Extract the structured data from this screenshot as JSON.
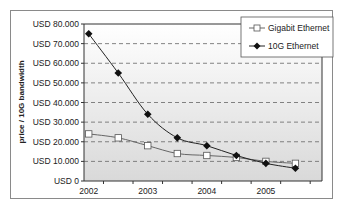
{
  "chart_data": {
    "type": "line",
    "title": "",
    "xlabel": "",
    "ylabel": "price / 10G bandwidth",
    "ylim": [
      0,
      80000
    ],
    "yticks": [
      "USD 0",
      "USD 10.000",
      "USD 20.000",
      "USD 30.000",
      "USD 40.000",
      "USD 50.000",
      "USD 60.000",
      "USD 70.000",
      "USD 80.000"
    ],
    "xticks": [
      "2002",
      "2003",
      "2004",
      "2005"
    ],
    "x": [
      2002.0,
      2002.5,
      2003.0,
      2003.5,
      2004.0,
      2004.5,
      2005.0,
      2005.5
    ],
    "series": [
      {
        "name": "Gigabit Ethernet",
        "marker": "open-square",
        "values": [
          24000,
          22000,
          18000,
          14000,
          13000,
          12000,
          10000,
          9000
        ]
      },
      {
        "name": "10G Ethernet",
        "marker": "filled-diamond",
        "values": [
          75000,
          55000,
          34000,
          22000,
          18000,
          13000,
          9000,
          6500
        ]
      }
    ],
    "grid": {
      "horizontal": true,
      "style": "dashed"
    },
    "legend_position": "top-right-inside"
  },
  "legend": {
    "items": [
      "Gigabit Ethernet",
      "10G Ethernet"
    ]
  },
  "axis": {
    "ylabel": "price / 10G bandwidth"
  }
}
